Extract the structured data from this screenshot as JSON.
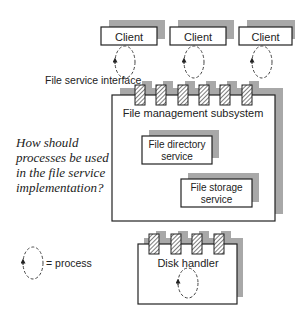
{
  "colors": {
    "shadow": "#a8a8a8",
    "stroke": "#222222",
    "hatch": "#444444",
    "background": "#ffffff"
  },
  "clients": [
    {
      "label": "Client"
    },
    {
      "label": "Client"
    },
    {
      "label": "Client"
    }
  ],
  "interface_label": "File service interface",
  "subsystem": {
    "title": "File management subsystem",
    "directory_service": {
      "line1": "File directory",
      "line2": "service"
    },
    "storage_service": {
      "line1": "File storage",
      "line2": "service"
    }
  },
  "question": {
    "line1": "How should",
    "line2": "processes be used",
    "line3": "in the file service",
    "line4": "implementation?"
  },
  "legend": {
    "label": "= process",
    "icon": "process-loop-icon"
  },
  "disk_handler": {
    "label": "Disk handler"
  }
}
